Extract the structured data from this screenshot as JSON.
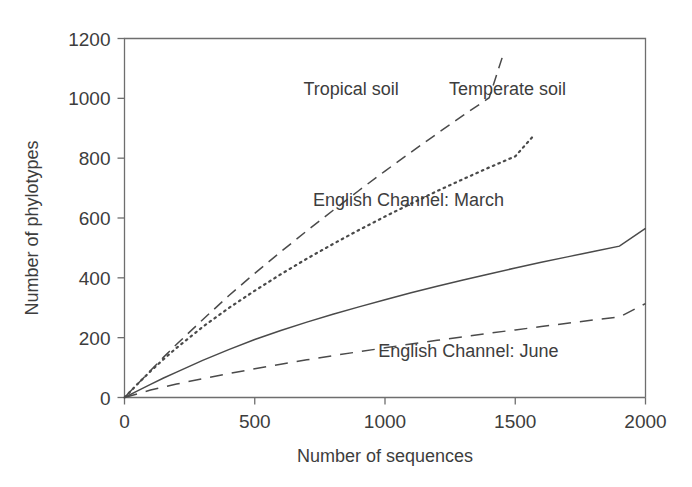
{
  "chart_data": {
    "type": "line",
    "title": "",
    "xlabel": "Number of sequences",
    "ylabel": "Number of phylotypes",
    "xlim": [
      0,
      2000
    ],
    "ylim": [
      0,
      1200
    ],
    "xticks": [
      0,
      500,
      1000,
      1500,
      2000
    ],
    "yticks": [
      0,
      200,
      400,
      600,
      800,
      1000,
      1200
    ],
    "xtick_labels": [
      "0",
      "500",
      "1000",
      "1500",
      "2000"
    ],
    "ytick_labels": [
      "0",
      "200",
      "400",
      "600",
      "800",
      "1000",
      "1200"
    ],
    "grid": false,
    "legend_position": "inline-annotations",
    "series": [
      {
        "name": "Tropical soil",
        "style": "long-dashed",
        "label_x": 870,
        "label_y": 1010,
        "x": [
          0,
          50,
          100,
          150,
          200,
          300,
          400,
          500,
          600,
          700,
          800,
          900,
          1000,
          1100,
          1200,
          1300,
          1400,
          1455
        ],
        "y": [
          0,
          45,
          90,
          135,
          178,
          260,
          340,
          415,
          487,
          557,
          625,
          692,
          757,
          820,
          882,
          943,
          1002,
          1150
        ]
      },
      {
        "name": "Temperate soil",
        "style": "dotted",
        "label_x": 1470,
        "label_y": 1010,
        "x": [
          0,
          50,
          100,
          150,
          200,
          300,
          400,
          500,
          600,
          700,
          800,
          900,
          1000,
          1100,
          1200,
          1300,
          1400,
          1500,
          1570
        ],
        "y": [
          0,
          45,
          88,
          128,
          166,
          236,
          299,
          357,
          412,
          464,
          513,
          560,
          605,
          648,
          690,
          730,
          769,
          806,
          875
        ]
      },
      {
        "name": "English Channel: March",
        "style": "solid",
        "label_x": 1090,
        "label_y": 640,
        "x": [
          0,
          50,
          100,
          150,
          200,
          300,
          400,
          500,
          600,
          700,
          800,
          900,
          1000,
          1100,
          1200,
          1300,
          1400,
          1500,
          1600,
          1700,
          1800,
          1900,
          2000
        ],
        "y": [
          0,
          22,
          44,
          65,
          85,
          124,
          160,
          194,
          224,
          252,
          278,
          303,
          327,
          350,
          372,
          393,
          413,
          433,
          452,
          470,
          488,
          506,
          565
        ]
      },
      {
        "name": "English Channel: June",
        "style": "dashed",
        "label_x": 1320,
        "label_y": 135,
        "x": [
          0,
          100,
          200,
          300,
          400,
          500,
          600,
          700,
          800,
          900,
          1000,
          1100,
          1200,
          1300,
          1400,
          1500,
          1600,
          1700,
          1800,
          1900,
          2000
        ],
        "y": [
          0,
          25,
          45,
          63,
          80,
          96,
          111,
          126,
          140,
          153,
          166,
          179,
          191,
          203,
          215,
          226,
          237,
          248,
          259,
          269,
          314
        ]
      }
    ]
  },
  "colors": {
    "ink": "#3d3d3d",
    "curve": "#4a4a4a",
    "axis": "#6e6e6e",
    "background": "#ffffff"
  }
}
